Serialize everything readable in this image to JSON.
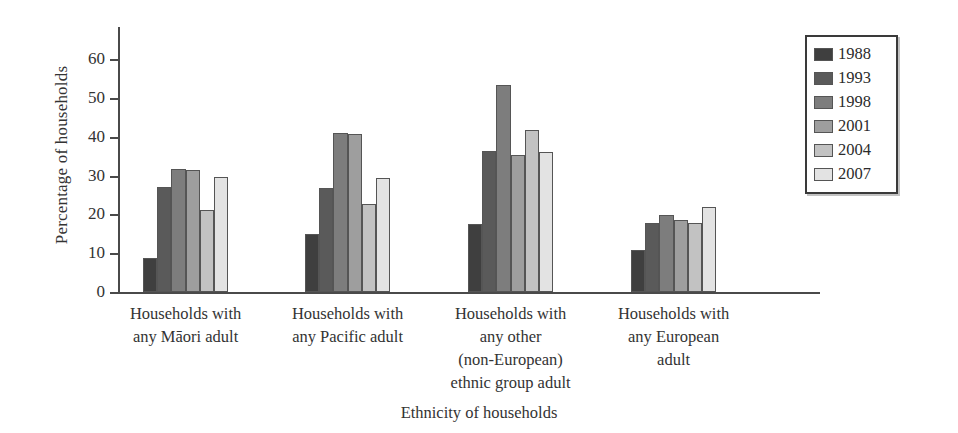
{
  "chart_data": {
    "type": "bar",
    "title": "",
    "xlabel": "Ethnicity of households",
    "ylabel": "Percentage of households",
    "ylim": [
      0,
      68
    ],
    "ytick_values": [
      0,
      10,
      20,
      30,
      40,
      50,
      60
    ],
    "ytick_labels": [
      "0",
      "10",
      "20",
      "30",
      "40",
      "50",
      "60"
    ],
    "grid": false,
    "legend_position": "top-right",
    "categories": [
      "Households with\nany Māori adult",
      "Households with\nany Pacific adult",
      "Households with\nany other\n(non-European)\nethnic group adult",
      "Households with\nany European\nadult"
    ],
    "series": [
      {
        "name": "1988",
        "color": "#3f3f3f",
        "values": [
          8.7,
          15.0,
          17.4,
          10.7
        ]
      },
      {
        "name": "1993",
        "color": "#5a5a5a",
        "values": [
          27.0,
          26.9,
          36.4,
          17.7
        ]
      },
      {
        "name": "1998",
        "color": "#7d7d7d",
        "values": [
          31.8,
          41.0,
          53.3,
          19.8
        ]
      },
      {
        "name": "2001",
        "color": "#9e9e9e",
        "values": [
          31.3,
          40.7,
          35.4,
          18.6
        ]
      },
      {
        "name": "2004",
        "color": "#c2c2c2",
        "values": [
          21.0,
          22.6,
          41.8,
          17.7
        ]
      },
      {
        "name": "2007",
        "color": "#e3e3e3",
        "values": [
          29.7,
          29.4,
          36.1,
          21.9
        ]
      }
    ]
  },
  "axis": {
    "y_title": "Percentage of households",
    "x_title": "Ethnicity of households"
  },
  "categories_lines": [
    [
      "Households with",
      "any Māori adult"
    ],
    [
      "Households with",
      "any Pacific adult"
    ],
    [
      "Households with",
      "any other",
      "(non-European)",
      "ethnic group adult"
    ],
    [
      "Households with",
      "any European",
      "adult"
    ]
  ],
  "legend": {
    "items": [
      {
        "label": "1988",
        "color": "#3f3f3f"
      },
      {
        "label": "1993",
        "color": "#5a5a5a"
      },
      {
        "label": "1998",
        "color": "#7d7d7d"
      },
      {
        "label": "2001",
        "color": "#9e9e9e"
      },
      {
        "label": "2004",
        "color": "#c2c2c2"
      },
      {
        "label": "2007",
        "color": "#e3e3e3"
      }
    ]
  }
}
